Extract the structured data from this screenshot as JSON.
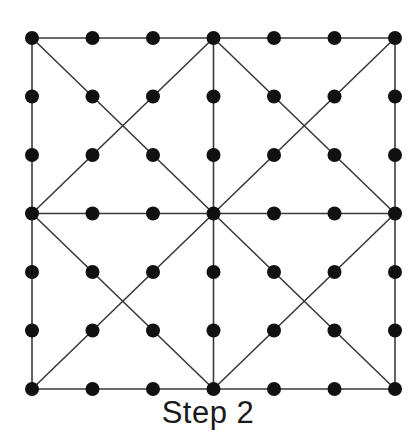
{
  "figure": {
    "caption": "Step 2",
    "background_color": "#ffffff",
    "node_color": "#111111",
    "edge_color": "#3a3a3a",
    "node_radius": 7,
    "edge_width": 1.6
  },
  "chart_data": {
    "type": "diagram",
    "title": "Step 2",
    "grid": {
      "rows": 7,
      "cols": 7,
      "x_start": 32,
      "y_start": 38,
      "x_spacing": 60.5,
      "y_spacing": 58.5
    },
    "node_count": 49,
    "nodes": [
      {
        "id": "r0c0",
        "x": 32,
        "y": 38
      },
      {
        "id": "r0c1",
        "x": 92.5,
        "y": 38
      },
      {
        "id": "r0c2",
        "x": 153,
        "y": 38
      },
      {
        "id": "r0c3",
        "x": 213.5,
        "y": 38
      },
      {
        "id": "r0c4",
        "x": 274,
        "y": 38
      },
      {
        "id": "r0c5",
        "x": 334.5,
        "y": 38
      },
      {
        "id": "r0c6",
        "x": 395,
        "y": 38
      },
      {
        "id": "r1c0",
        "x": 32,
        "y": 96.5
      },
      {
        "id": "r1c1",
        "x": 92.5,
        "y": 96.5
      },
      {
        "id": "r1c2",
        "x": 153,
        "y": 96.5
      },
      {
        "id": "r1c3",
        "x": 213.5,
        "y": 96.5
      },
      {
        "id": "r1c4",
        "x": 274,
        "y": 96.5
      },
      {
        "id": "r1c5",
        "x": 334.5,
        "y": 96.5
      },
      {
        "id": "r1c6",
        "x": 395,
        "y": 96.5
      },
      {
        "id": "r2c0",
        "x": 32,
        "y": 155
      },
      {
        "id": "r2c1",
        "x": 92.5,
        "y": 155
      },
      {
        "id": "r2c2",
        "x": 153,
        "y": 155
      },
      {
        "id": "r2c3",
        "x": 213.5,
        "y": 155
      },
      {
        "id": "r2c4",
        "x": 274,
        "y": 155
      },
      {
        "id": "r2c5",
        "x": 334.5,
        "y": 155
      },
      {
        "id": "r2c6",
        "x": 395,
        "y": 155
      },
      {
        "id": "r3c0",
        "x": 32,
        "y": 213.5
      },
      {
        "id": "r3c1",
        "x": 92.5,
        "y": 213.5
      },
      {
        "id": "r3c2",
        "x": 153,
        "y": 213.5
      },
      {
        "id": "r3c3",
        "x": 213.5,
        "y": 213.5
      },
      {
        "id": "r3c4",
        "x": 274,
        "y": 213.5
      },
      {
        "id": "r3c5",
        "x": 334.5,
        "y": 213.5
      },
      {
        "id": "r3c6",
        "x": 395,
        "y": 213.5
      },
      {
        "id": "r4c0",
        "x": 32,
        "y": 272
      },
      {
        "id": "r4c1",
        "x": 92.5,
        "y": 272
      },
      {
        "id": "r4c2",
        "x": 153,
        "y": 272
      },
      {
        "id": "r4c3",
        "x": 213.5,
        "y": 272
      },
      {
        "id": "r4c4",
        "x": 274,
        "y": 272
      },
      {
        "id": "r4c5",
        "x": 334.5,
        "y": 272
      },
      {
        "id": "r4c6",
        "x": 395,
        "y": 272
      },
      {
        "id": "r5c0",
        "x": 32,
        "y": 330.5
      },
      {
        "id": "r5c1",
        "x": 92.5,
        "y": 330.5
      },
      {
        "id": "r5c2",
        "x": 153,
        "y": 330.5
      },
      {
        "id": "r5c3",
        "x": 213.5,
        "y": 330.5
      },
      {
        "id": "r5c4",
        "x": 274,
        "y": 330.5
      },
      {
        "id": "r5c5",
        "x": 334.5,
        "y": 330.5
      },
      {
        "id": "r5c6",
        "x": 395,
        "y": 330.5
      },
      {
        "id": "r6c0",
        "x": 32,
        "y": 389
      },
      {
        "id": "r6c1",
        "x": 92.5,
        "y": 389
      },
      {
        "id": "r6c2",
        "x": 153,
        "y": 389
      },
      {
        "id": "r6c3",
        "x": 213.5,
        "y": 389
      },
      {
        "id": "r6c4",
        "x": 274,
        "y": 389
      },
      {
        "id": "r6c5",
        "x": 334.5,
        "y": 389
      },
      {
        "id": "r6c6",
        "x": 395,
        "y": 389
      }
    ],
    "edges": [
      {
        "name": "border-top",
        "x1": 32,
        "y1": 38,
        "x2": 395,
        "y2": 38
      },
      {
        "name": "border-bottom",
        "x1": 32,
        "y1": 389,
        "x2": 395,
        "y2": 389
      },
      {
        "name": "border-left",
        "x1": 32,
        "y1": 38,
        "x2": 32,
        "y2": 389
      },
      {
        "name": "border-right",
        "x1": 395,
        "y1": 38,
        "x2": 395,
        "y2": 389
      },
      {
        "name": "midline-horizontal",
        "x1": 32,
        "y1": 213.5,
        "x2": 395,
        "y2": 213.5
      },
      {
        "name": "midline-vertical",
        "x1": 213.5,
        "y1": 38,
        "x2": 213.5,
        "y2": 389
      },
      {
        "name": "diag-tl-quadrant-down",
        "x1": 32,
        "y1": 38,
        "x2": 213.5,
        "y2": 213.5
      },
      {
        "name": "diag-tl-quadrant-up",
        "x1": 32,
        "y1": 213.5,
        "x2": 213.5,
        "y2": 38
      },
      {
        "name": "diag-tr-quadrant-down",
        "x1": 213.5,
        "y1": 38,
        "x2": 395,
        "y2": 213.5
      },
      {
        "name": "diag-tr-quadrant-up",
        "x1": 213.5,
        "y1": 213.5,
        "x2": 395,
        "y2": 38
      },
      {
        "name": "diag-bl-quadrant-down",
        "x1": 32,
        "y1": 213.5,
        "x2": 213.5,
        "y2": 389
      },
      {
        "name": "diag-bl-quadrant-up",
        "x1": 32,
        "y1": 389,
        "x2": 213.5,
        "y2": 213.5
      },
      {
        "name": "diag-br-quadrant-down",
        "x1": 213.5,
        "y1": 213.5,
        "x2": 395,
        "y2": 389
      },
      {
        "name": "diag-br-quadrant-up",
        "x1": 213.5,
        "y1": 389,
        "x2": 395,
        "y2": 213.5
      }
    ]
  }
}
